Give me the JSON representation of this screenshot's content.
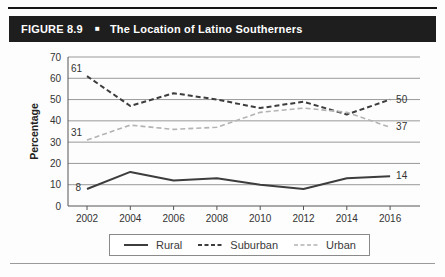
{
  "header": {
    "figure_label": "FIGURE 8.9",
    "bullet": "■",
    "title": "The Location of Latino Southerners"
  },
  "chart_data": {
    "type": "line",
    "x": [
      2002,
      2004,
      2006,
      2008,
      2010,
      2012,
      2014,
      2016
    ],
    "series": [
      {
        "name": "Rural",
        "values": [
          8,
          16,
          12,
          13,
          10,
          8,
          13,
          14
        ],
        "style": "solid",
        "color": "#3d3d3d"
      },
      {
        "name": "Suburban",
        "values": [
          61,
          47,
          53,
          50,
          46,
          49,
          43,
          50
        ],
        "style": "dashed",
        "color": "#3d3d3d"
      },
      {
        "name": "Urban",
        "values": [
          31,
          38,
          36,
          37,
          44,
          46,
          44,
          37
        ],
        "style": "dashed",
        "color": "#b3b3b3"
      }
    ],
    "ylabel": "Percentage",
    "ylim": [
      0,
      70
    ],
    "ytick_step": 10,
    "grid": true,
    "legend_position": "bottom",
    "annotations": [
      {
        "label": "61",
        "series": "Suburban",
        "x": 2002,
        "dx": -5,
        "dy": -4,
        "anchor": "end"
      },
      {
        "label": "31",
        "series": "Urban",
        "x": 2002,
        "dx": -5,
        "dy": -4,
        "anchor": "end"
      },
      {
        "label": "8",
        "series": "Rural",
        "x": 2002,
        "dx": -6,
        "dy": 2,
        "anchor": "end"
      },
      {
        "label": "50",
        "series": "Suburban",
        "x": 2016,
        "dx": 6,
        "dy": 3,
        "anchor": "start"
      },
      {
        "label": "37",
        "series": "Urban",
        "x": 2016,
        "dx": 6,
        "dy": 3,
        "anchor": "start"
      },
      {
        "label": "14",
        "series": "Rural",
        "x": 2016,
        "dx": 6,
        "dy": 3,
        "anchor": "start"
      }
    ],
    "axis_color": "#555555",
    "grid_color": "#999999",
    "tick_text_color": "#333333"
  },
  "legend": {
    "items": [
      "Rural",
      "Suburban",
      "Urban"
    ]
  }
}
